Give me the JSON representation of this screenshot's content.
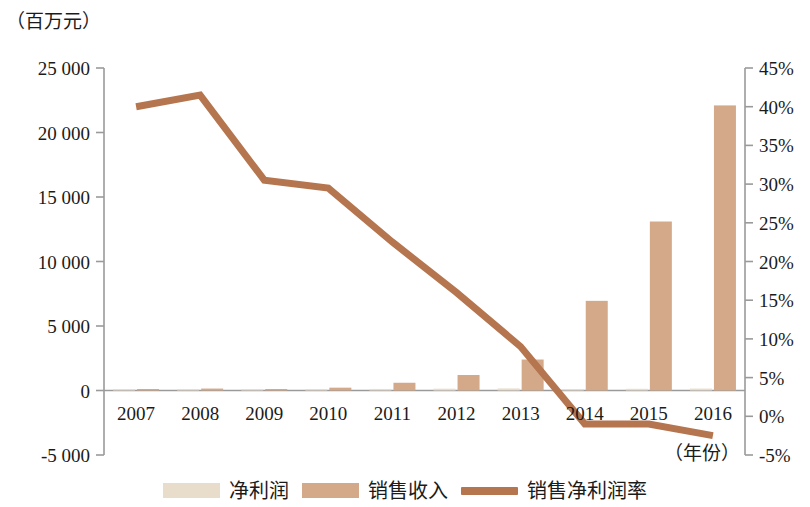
{
  "axis_unit_label": "（百万元）",
  "x_unit_label": "（年份）",
  "legend": [
    {
      "key": "net_profit",
      "label": "净利润",
      "color": "#e8dccb",
      "type": "bar"
    },
    {
      "key": "sales_revenue",
      "label": "销售收入",
      "color": "#d4a98a",
      "type": "bar"
    },
    {
      "key": "net_margin",
      "label": "销售净利润率",
      "color": "#b5754f",
      "type": "line"
    }
  ],
  "chart_data": {
    "type": "bar",
    "title": "",
    "subtitle": "",
    "xlabel": "（年份）",
    "ylabel": "（百万元）",
    "y2label": "",
    "categories": [
      "2007",
      "2008",
      "2009",
      "2010",
      "2011",
      "2012",
      "2013",
      "2014",
      "2015",
      "2016"
    ],
    "ylim": [
      -5000,
      25000
    ],
    "yticks": [
      "-5 000",
      "0",
      "5 000",
      "10 000",
      "15 000",
      "20 000",
      "25 000"
    ],
    "ytick_values": [
      -5000,
      0,
      5000,
      10000,
      15000,
      20000,
      25000
    ],
    "y2lim": [
      -5,
      45
    ],
    "y2ticks": [
      "-5%",
      "0%",
      "5%",
      "10%",
      "15%",
      "20%",
      "25%",
      "30%",
      "35%",
      "40%",
      "45%"
    ],
    "y2tick_values": [
      -5,
      0,
      5,
      10,
      15,
      20,
      25,
      30,
      35,
      40,
      45
    ],
    "grid": false,
    "legend_position": "bottom",
    "series": [
      {
        "name": "净利润",
        "type": "bar",
        "axis": "left",
        "color": "#e8dccb",
        "values": [
          40,
          60,
          50,
          80,
          120,
          140,
          160,
          90,
          130,
          150
        ]
      },
      {
        "name": "销售收入",
        "type": "bar",
        "axis": "left",
        "color": "#d4a98a",
        "values": [
          100,
          150,
          100,
          220,
          600,
          1200,
          2400,
          6950,
          13100,
          22100
        ]
      },
      {
        "name": "销售净利润率",
        "type": "line",
        "axis": "right",
        "color": "#b5754f",
        "values": [
          40.0,
          41.5,
          30.5,
          29.5,
          22.5,
          16.0,
          9.0,
          -1.0,
          -1.0,
          -2.5
        ]
      }
    ]
  }
}
